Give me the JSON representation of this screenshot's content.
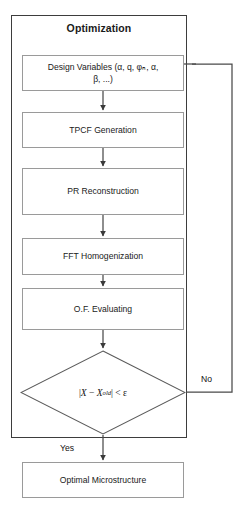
{
  "figure": {
    "type": "flowchart",
    "title": "Optimization",
    "container_label": "Optimization"
  },
  "nodes": {
    "design_variables": {
      "id": "design-variables",
      "shape": "process",
      "line1": "Design Variables (α, q, φₙ, α,",
      "line2": "β, ...)",
      "text": "Design Variables (α, q, φₙ, α, β, ...)"
    },
    "tpcf": {
      "id": "tpcf-generation",
      "shape": "process",
      "text": "TPCF Generation"
    },
    "pr": {
      "id": "pr-reconstruction",
      "shape": "process",
      "text": "PR Reconstruction"
    },
    "fft": {
      "id": "fft-homogenization",
      "shape": "process",
      "text": "FFT Homogenization"
    },
    "of": {
      "id": "of-evaluating",
      "shape": "process",
      "text": "O.F. Evaluating"
    },
    "decision": {
      "id": "convergence-check",
      "shape": "diamond",
      "expr_left_bar": "|",
      "expr_x": "X",
      "expr_minus": "−",
      "expr_xold_base": "X",
      "expr_xold_sup": "old",
      "expr_right_bar": "|",
      "expr_cmp": "< ε",
      "text": "|X − X^old| < ε"
    },
    "optimal": {
      "id": "optimal-microstructure",
      "shape": "process",
      "text": "Optimal Microstructure"
    }
  },
  "edges": {
    "no_label": "No",
    "yes_label": "Yes"
  },
  "colors": {
    "frame_stroke": "#3d3d3d",
    "box_stroke": "#9a9a9a",
    "connector": "#4a4a4a",
    "text": "#1a1a1a",
    "background": "#ffffff"
  }
}
